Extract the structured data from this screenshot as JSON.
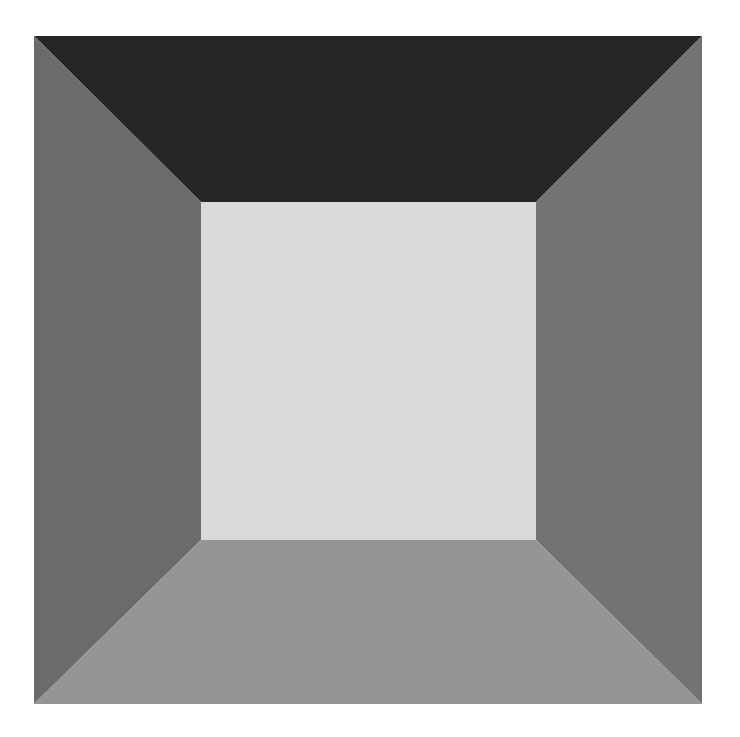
{
  "artwork": {
    "background": "#ffffff",
    "outer": {
      "x1": 34,
      "y1": 36,
      "x2": 702,
      "y2": 704
    },
    "inner": {
      "x1": 201,
      "y1": 202,
      "x2": 536,
      "y2": 540
    },
    "colors": {
      "top": "#262626",
      "left": "#6b6b6b",
      "right": "#737373",
      "bottom": "#959595",
      "center": "#d9d9d9"
    }
  }
}
